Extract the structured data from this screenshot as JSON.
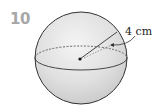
{
  "question_number": "10",
  "figure": {
    "shape": "sphere",
    "radius_label": "4 cm",
    "colors": {
      "fill_light": "#f2f2f2",
      "fill_dark": "#d4d4d4",
      "outline": "#333333"
    }
  }
}
